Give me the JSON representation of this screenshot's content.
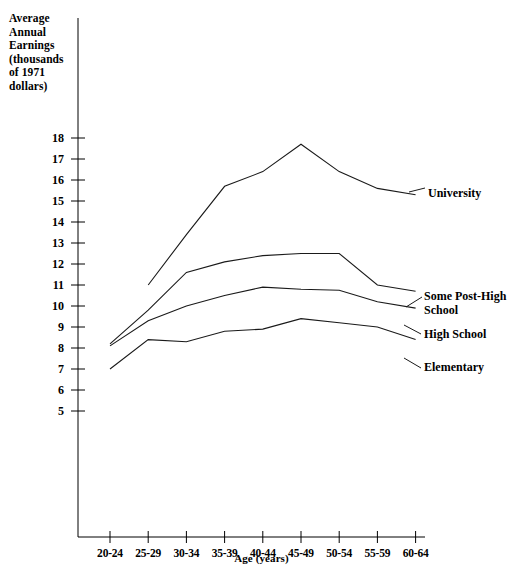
{
  "chart_data": {
    "type": "line",
    "title": "",
    "ylabel": "Average\nAnnual\nEarnings\n(thousands\nof 1971\ndollars)",
    "xlabel": "Age (years)",
    "categories": [
      "20-24",
      "25-29",
      "30-34",
      "35-39",
      "40-44",
      "45-49",
      "50-54",
      "55-59",
      "60-64"
    ],
    "ylim": [
      5,
      18
    ],
    "yticks": [
      18,
      17,
      16,
      15,
      14,
      13,
      12,
      11,
      10,
      9,
      8,
      7,
      6,
      5
    ],
    "grid": false,
    "legend_position": "right-inline-labels",
    "series": [
      {
        "name": "University",
        "values": [
          null,
          11.0,
          13.4,
          15.7,
          16.4,
          17.7,
          16.4,
          15.6,
          15.3
        ]
      },
      {
        "name": "Some Post-High School",
        "values": [
          8.2,
          9.8,
          11.6,
          12.1,
          12.4,
          12.5,
          12.5,
          11.0,
          10.7
        ]
      },
      {
        "name": "High School",
        "values": [
          8.1,
          9.3,
          10.0,
          10.5,
          10.9,
          10.8,
          10.75,
          10.2,
          9.9
        ]
      },
      {
        "name": "Elementary",
        "values": [
          7.0,
          8.4,
          8.3,
          8.8,
          8.9,
          9.4,
          9.2,
          9.0,
          8.4
        ]
      }
    ]
  },
  "axis": {
    "y_title": "Average\nAnnual\nEarnings\n(thousands\nof 1971\ndollars)",
    "x_title": "Age (years)"
  },
  "series_labels": {
    "university": "University",
    "post_high": "Some Post-High\nSchool",
    "high_school": "High School",
    "elementary": "Elementary"
  }
}
